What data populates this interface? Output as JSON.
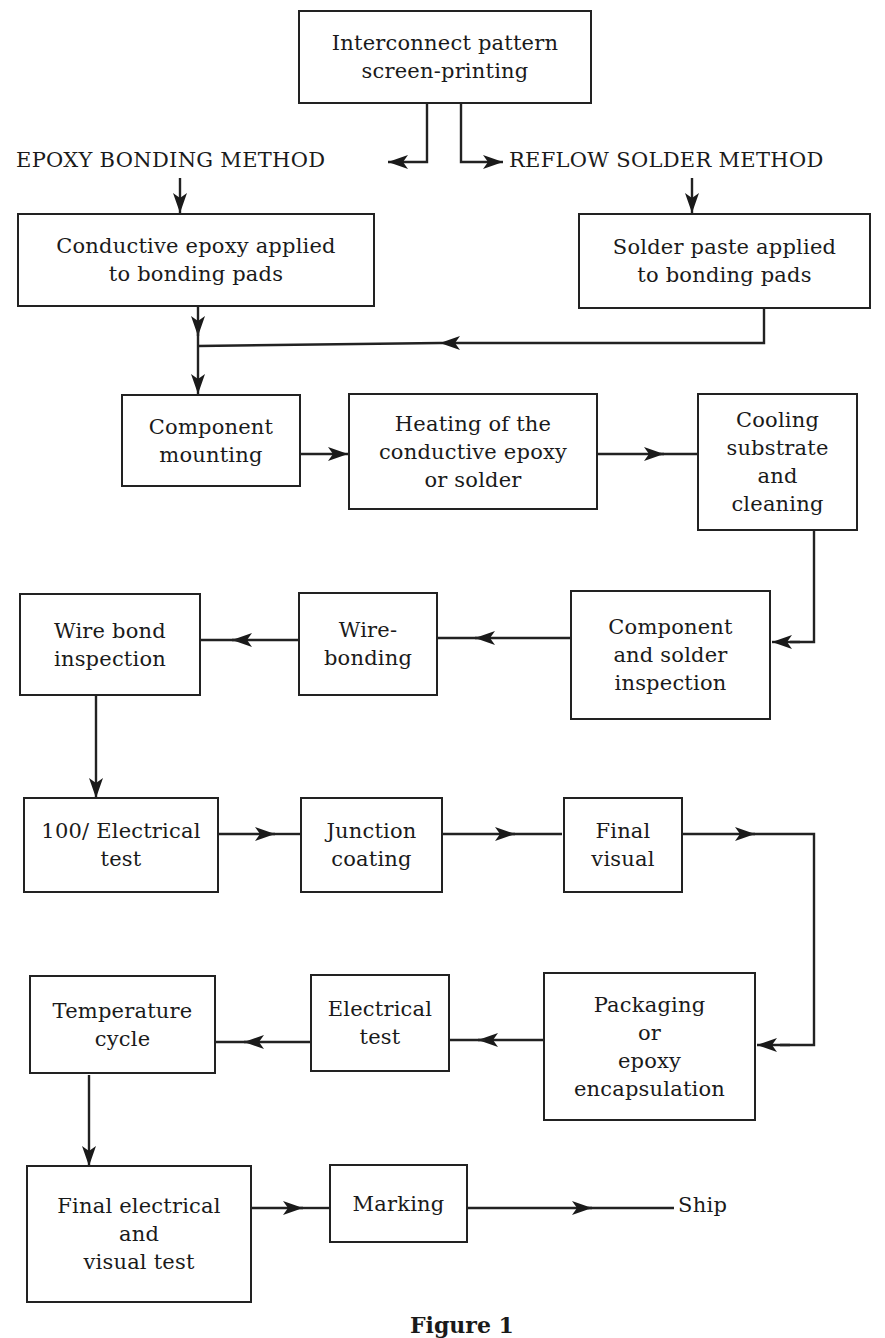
{
  "diagram": {
    "type": "flowchart",
    "caption": "Figure 1",
    "branch_labels": {
      "epoxy": "EPOXY BONDING METHOD",
      "reflow": "REFLOW SOLDER METHOD"
    },
    "terminal": "Ship",
    "nodes": [
      {
        "id": "interconnect",
        "label": "Interconnect pattern\nscreen-printing"
      },
      {
        "id": "epoxy_applied",
        "label": "Conductive epoxy applied\nto bonding pads"
      },
      {
        "id": "solder_applied",
        "label": "Solder paste applied\nto bonding pads"
      },
      {
        "id": "mounting",
        "label": "Component\nmounting"
      },
      {
        "id": "heating",
        "label": "Heating of the\nconductive epoxy\nor solder"
      },
      {
        "id": "cooling",
        "label": "Cooling\nsubstrate\nand\ncleaning"
      },
      {
        "id": "comp_inspection",
        "label": "Component\nand solder\ninspection"
      },
      {
        "id": "wirebonding",
        "label": "Wire-\nbonding"
      },
      {
        "id": "wb_inspection",
        "label": "Wire bond\ninspection"
      },
      {
        "id": "elec_test_100",
        "label": "100/ Electrical\ntest"
      },
      {
        "id": "junction",
        "label": "Junction\ncoating"
      },
      {
        "id": "final_visual",
        "label": "Final\nvisual"
      },
      {
        "id": "packaging",
        "label": "Packaging\nor\nepoxy\nencapsulation"
      },
      {
        "id": "elec_test",
        "label": "Electrical\ntest"
      },
      {
        "id": "temp_cycle",
        "label": "Temperature\ncycle"
      },
      {
        "id": "final_test",
        "label": "Final electrical\nand\nvisual test"
      },
      {
        "id": "marking",
        "label": "Marking"
      }
    ],
    "edges": [
      [
        "interconnect",
        "EPOXY BONDING METHOD"
      ],
      [
        "interconnect",
        "REFLOW SOLDER METHOD"
      ],
      [
        "EPOXY BONDING METHOD",
        "epoxy_applied"
      ],
      [
        "REFLOW SOLDER METHOD",
        "solder_applied"
      ],
      [
        "epoxy_applied",
        "mounting"
      ],
      [
        "solder_applied",
        "mounting"
      ],
      [
        "mounting",
        "heating"
      ],
      [
        "heating",
        "cooling"
      ],
      [
        "cooling",
        "comp_inspection"
      ],
      [
        "comp_inspection",
        "wirebonding"
      ],
      [
        "wirebonding",
        "wb_inspection"
      ],
      [
        "wb_inspection",
        "elec_test_100"
      ],
      [
        "elec_test_100",
        "junction"
      ],
      [
        "junction",
        "final_visual"
      ],
      [
        "final_visual",
        "packaging"
      ],
      [
        "packaging",
        "elec_test"
      ],
      [
        "elec_test",
        "temp_cycle"
      ],
      [
        "temp_cycle",
        "final_test"
      ],
      [
        "final_test",
        "marking"
      ],
      [
        "marking",
        "Ship"
      ]
    ]
  }
}
